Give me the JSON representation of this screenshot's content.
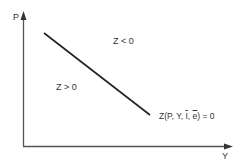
{
  "diagram": {
    "axes": {
      "y_label": "P",
      "x_label": "Y"
    },
    "regions": {
      "above": "Z < 0",
      "below": "Z > 0"
    },
    "curve_label": {
      "prefix": "Z(P, Y, ",
      "i_bar": "I",
      "sep": ", ",
      "e_bar": "e",
      "suffix": ") = 0"
    },
    "colors": {
      "line": "#222222",
      "axis": "#555555",
      "text": "#333333"
    }
  }
}
